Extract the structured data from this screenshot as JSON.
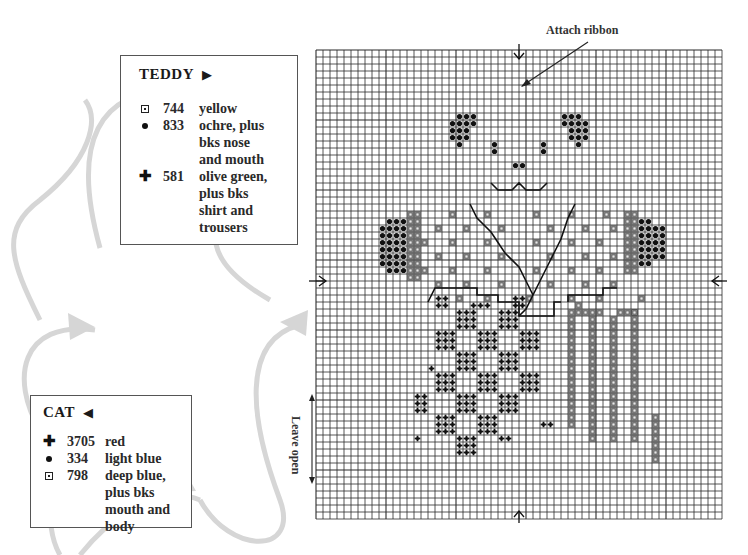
{
  "teddy_key": {
    "title": "TEDDY",
    "title_arrow": "▶",
    "entries": [
      {
        "symbol": "boxed-dot",
        "code": "744",
        "desc": "yellow"
      },
      {
        "symbol": "dot",
        "code": "833",
        "desc": "ochre, plus\nbks nose\nand mouth"
      },
      {
        "symbol": "cross",
        "code": "581",
        "desc": "olive green,\nplus bks\nshirt and\ntrousers"
      }
    ]
  },
  "cat_key": {
    "title": "CAT",
    "title_arrow": "◀",
    "entries": [
      {
        "symbol": "cross",
        "code": "3705",
        "desc": "red"
      },
      {
        "symbol": "dot",
        "code": "334",
        "desc": "light blue"
      },
      {
        "symbol": "boxed-dot",
        "code": "798",
        "desc": "deep blue,\nplus bks\nmouth and\nbody"
      }
    ]
  },
  "annotations": {
    "attach_ribbon": "Attach ribbon",
    "leave_open": "Leave open"
  },
  "symbols": {
    "cross_glyph": "✚",
    "colors": {
      "grid": "#2b2b2b",
      "flow_arrow": "#d4d4d4",
      "ink": "#111111",
      "boxed_fill": "#9a9a9a"
    }
  },
  "grid": {
    "cols": 58,
    "rows": 67,
    "cell": 7,
    "left": 316,
    "top": 50
  },
  "stitches": {
    "dot": [
      [
        20,
        9
      ],
      [
        21,
        9
      ],
      [
        22,
        9
      ],
      [
        19,
        10
      ],
      [
        20,
        10
      ],
      [
        21,
        10
      ],
      [
        22,
        10
      ],
      [
        19,
        11
      ],
      [
        20,
        11
      ],
      [
        21,
        11
      ],
      [
        19,
        12
      ],
      [
        20,
        12
      ],
      [
        21,
        12
      ],
      [
        20,
        13
      ],
      [
        35,
        9
      ],
      [
        36,
        9
      ],
      [
        37,
        9
      ],
      [
        35,
        10
      ],
      [
        36,
        10
      ],
      [
        37,
        10
      ],
      [
        38,
        10
      ],
      [
        36,
        11
      ],
      [
        37,
        11
      ],
      [
        38,
        11
      ],
      [
        36,
        12
      ],
      [
        37,
        12
      ],
      [
        38,
        12
      ],
      [
        37,
        13
      ],
      [
        25,
        13
      ],
      [
        25,
        14
      ],
      [
        32,
        13
      ],
      [
        32,
        14
      ],
      [
        28,
        16
      ],
      [
        29,
        16
      ],
      [
        10,
        24
      ],
      [
        11,
        24
      ],
      [
        12,
        24
      ],
      [
        9,
        25
      ],
      [
        10,
        25
      ],
      [
        11,
        25
      ],
      [
        12,
        25
      ],
      [
        9,
        26
      ],
      [
        10,
        26
      ],
      [
        11,
        26
      ],
      [
        12,
        26
      ],
      [
        9,
        27
      ],
      [
        10,
        27
      ],
      [
        11,
        27
      ],
      [
        12,
        27
      ],
      [
        9,
        28
      ],
      [
        10,
        28
      ],
      [
        11,
        28
      ],
      [
        12,
        28
      ],
      [
        9,
        29
      ],
      [
        10,
        29
      ],
      [
        11,
        29
      ],
      [
        12,
        29
      ],
      [
        9,
        30
      ],
      [
        10,
        30
      ],
      [
        11,
        30
      ],
      [
        12,
        30
      ],
      [
        10,
        31
      ],
      [
        11,
        31
      ],
      [
        12,
        31
      ],
      [
        46,
        24
      ],
      [
        47,
        24
      ],
      [
        46,
        25
      ],
      [
        47,
        25
      ],
      [
        48,
        25
      ],
      [
        49,
        25
      ],
      [
        46,
        26
      ],
      [
        47,
        26
      ],
      [
        48,
        26
      ],
      [
        49,
        26
      ],
      [
        46,
        27
      ],
      [
        47,
        27
      ],
      [
        48,
        27
      ],
      [
        49,
        27
      ],
      [
        46,
        28
      ],
      [
        47,
        28
      ],
      [
        48,
        28
      ],
      [
        49,
        28
      ],
      [
        46,
        29
      ],
      [
        47,
        29
      ],
      [
        48,
        29
      ],
      [
        49,
        29
      ],
      [
        46,
        30
      ],
      [
        47,
        30
      ]
    ],
    "boxed": [
      [
        13,
        23
      ],
      [
        14,
        23
      ],
      [
        13,
        24
      ],
      [
        14,
        24
      ],
      [
        13,
        25
      ],
      [
        14,
        25
      ],
      [
        13,
        26
      ],
      [
        14,
        26
      ],
      [
        13,
        27
      ],
      [
        14,
        27
      ],
      [
        13,
        28
      ],
      [
        14,
        28
      ],
      [
        13,
        29
      ],
      [
        14,
        29
      ],
      [
        13,
        30
      ],
      [
        14,
        30
      ],
      [
        13,
        31
      ],
      [
        14,
        31
      ],
      [
        13,
        32
      ],
      [
        14,
        32
      ],
      [
        44,
        23
      ],
      [
        45,
        23
      ],
      [
        44,
        24
      ],
      [
        45,
        24
      ],
      [
        44,
        25
      ],
      [
        45,
        25
      ],
      [
        44,
        26
      ],
      [
        45,
        26
      ],
      [
        44,
        27
      ],
      [
        45,
        27
      ],
      [
        44,
        28
      ],
      [
        45,
        28
      ],
      [
        44,
        29
      ],
      [
        45,
        29
      ],
      [
        44,
        30
      ],
      [
        45,
        30
      ],
      [
        44,
        31
      ],
      [
        45,
        31
      ],
      [
        19,
        23
      ],
      [
        24,
        23
      ],
      [
        31,
        23
      ],
      [
        36,
        23
      ],
      [
        41,
        23
      ],
      [
        17,
        25
      ],
      [
        21,
        25
      ],
      [
        26,
        25
      ],
      [
        33,
        25
      ],
      [
        38,
        25
      ],
      [
        42,
        25
      ],
      [
        15,
        27
      ],
      [
        19,
        27
      ],
      [
        24,
        27
      ],
      [
        31,
        27
      ],
      [
        36,
        27
      ],
      [
        40,
        27
      ],
      [
        17,
        29
      ],
      [
        21,
        29
      ],
      [
        26,
        29
      ],
      [
        33,
        29
      ],
      [
        38,
        29
      ],
      [
        42,
        29
      ],
      [
        15,
        31
      ],
      [
        19,
        31
      ],
      [
        24,
        31
      ],
      [
        31,
        31
      ],
      [
        36,
        31
      ],
      [
        40,
        31
      ],
      [
        17,
        33
      ],
      [
        21,
        33
      ],
      [
        26,
        33
      ],
      [
        33,
        33
      ],
      [
        38,
        33
      ],
      [
        42,
        33
      ],
      [
        20,
        35
      ],
      [
        24,
        35
      ],
      [
        30,
        35
      ],
      [
        36,
        35
      ],
      [
        40,
        35
      ],
      [
        37,
        36
      ],
      [
        36,
        37
      ],
      [
        37,
        37
      ],
      [
        38,
        37
      ],
      [
        46,
        35
      ],
      [
        40,
        37
      ],
      [
        43,
        37
      ],
      [
        44,
        37
      ],
      [
        45,
        37
      ]
    ],
    "cross": [
      [
        17,
        35
      ],
      [
        18,
        35
      ],
      [
        17,
        36
      ],
      [
        18,
        36
      ],
      [
        28,
        35
      ],
      [
        29,
        35
      ],
      [
        28,
        36
      ],
      [
        29,
        36
      ],
      [
        22,
        36
      ],
      [
        23,
        36
      ],
      [
        24,
        36
      ],
      [
        20,
        37
      ],
      [
        21,
        37
      ],
      [
        22,
        37
      ],
      [
        20,
        38
      ],
      [
        21,
        38
      ],
      [
        22,
        38
      ],
      [
        20,
        39
      ],
      [
        21,
        39
      ],
      [
        22,
        39
      ],
      [
        26,
        37
      ],
      [
        27,
        37
      ],
      [
        28,
        37
      ],
      [
        26,
        38
      ],
      [
        27,
        38
      ],
      [
        28,
        38
      ],
      [
        26,
        39
      ],
      [
        27,
        39
      ],
      [
        28,
        39
      ],
      [
        17,
        40
      ],
      [
        18,
        40
      ],
      [
        19,
        40
      ],
      [
        17,
        41
      ],
      [
        18,
        41
      ],
      [
        19,
        41
      ],
      [
        17,
        42
      ],
      [
        18,
        42
      ],
      [
        19,
        42
      ],
      [
        23,
        40
      ],
      [
        24,
        40
      ],
      [
        25,
        40
      ],
      [
        23,
        41
      ],
      [
        24,
        41
      ],
      [
        25,
        41
      ],
      [
        23,
        42
      ],
      [
        24,
        42
      ],
      [
        25,
        42
      ],
      [
        29,
        40
      ],
      [
        30,
        40
      ],
      [
        31,
        40
      ],
      [
        29,
        41
      ],
      [
        30,
        41
      ],
      [
        31,
        41
      ],
      [
        29,
        42
      ],
      [
        30,
        42
      ],
      [
        31,
        42
      ],
      [
        20,
        43
      ],
      [
        21,
        43
      ],
      [
        22,
        43
      ],
      [
        20,
        44
      ],
      [
        21,
        44
      ],
      [
        22,
        44
      ],
      [
        20,
        45
      ],
      [
        21,
        45
      ],
      [
        22,
        45
      ],
      [
        26,
        43
      ],
      [
        27,
        43
      ],
      [
        28,
        43
      ],
      [
        26,
        44
      ],
      [
        27,
        44
      ],
      [
        28,
        44
      ],
      [
        26,
        45
      ],
      [
        27,
        45
      ],
      [
        28,
        45
      ],
      [
        16,
        45
      ],
      [
        17,
        46
      ],
      [
        18,
        46
      ],
      [
        19,
        46
      ],
      [
        17,
        47
      ],
      [
        18,
        47
      ],
      [
        19,
        47
      ],
      [
        17,
        48
      ],
      [
        18,
        48
      ],
      [
        19,
        48
      ],
      [
        23,
        46
      ],
      [
        24,
        46
      ],
      [
        25,
        46
      ],
      [
        23,
        47
      ],
      [
        24,
        47
      ],
      [
        25,
        47
      ],
      [
        23,
        48
      ],
      [
        24,
        48
      ],
      [
        25,
        48
      ],
      [
        29,
        46
      ],
      [
        30,
        46
      ],
      [
        31,
        46
      ],
      [
        29,
        47
      ],
      [
        30,
        47
      ],
      [
        31,
        47
      ],
      [
        29,
        48
      ],
      [
        30,
        48
      ],
      [
        31,
        48
      ],
      [
        14,
        49
      ],
      [
        15,
        49
      ],
      [
        14,
        50
      ],
      [
        15,
        50
      ],
      [
        14,
        51
      ],
      [
        15,
        51
      ],
      [
        20,
        49
      ],
      [
        21,
        49
      ],
      [
        22,
        49
      ],
      [
        20,
        50
      ],
      [
        21,
        50
      ],
      [
        22,
        50
      ],
      [
        20,
        51
      ],
      [
        21,
        51
      ],
      [
        22,
        51
      ],
      [
        26,
        49
      ],
      [
        27,
        49
      ],
      [
        28,
        49
      ],
      [
        26,
        50
      ],
      [
        27,
        50
      ],
      [
        28,
        50
      ],
      [
        26,
        51
      ],
      [
        27,
        51
      ],
      [
        28,
        51
      ],
      [
        17,
        52
      ],
      [
        18,
        52
      ],
      [
        19,
        52
      ],
      [
        17,
        53
      ],
      [
        18,
        53
      ],
      [
        19,
        53
      ],
      [
        17,
        54
      ],
      [
        18,
        54
      ],
      [
        19,
        54
      ],
      [
        23,
        52
      ],
      [
        24,
        52
      ],
      [
        25,
        52
      ],
      [
        23,
        53
      ],
      [
        24,
        53
      ],
      [
        25,
        53
      ],
      [
        23,
        54
      ],
      [
        24,
        54
      ],
      [
        25,
        54
      ],
      [
        32,
        53
      ],
      [
        33,
        53
      ],
      [
        14,
        55
      ],
      [
        26,
        55
      ],
      [
        27,
        55
      ],
      [
        20,
        55
      ],
      [
        21,
        55
      ],
      [
        22,
        55
      ],
      [
        20,
        56
      ],
      [
        21,
        56
      ],
      [
        22,
        56
      ],
      [
        20,
        57
      ],
      [
        21,
        57
      ],
      [
        22,
        57
      ]
    ],
    "boxed_columns": [
      {
        "col": 36,
        "from": 38,
        "to": 53
      },
      {
        "col": 39,
        "from": 37,
        "to": 55
      },
      {
        "col": 42,
        "from": 38,
        "to": 55
      },
      {
        "col": 45,
        "from": 37,
        "to": 55
      },
      {
        "col": 48,
        "from": 52,
        "to": 58
      }
    ]
  },
  "backstitch_lines": [
    [
      [
        25,
        19
      ],
      [
        26,
        20
      ],
      [
        28,
        20
      ],
      [
        29,
        19
      ],
      [
        30,
        20
      ],
      [
        32,
        20
      ],
      [
        33,
        19
      ]
    ],
    [
      [
        22,
        22
      ],
      [
        23,
        24
      ],
      [
        25,
        26
      ],
      [
        27,
        29
      ],
      [
        29,
        31
      ],
      [
        30,
        33
      ],
      [
        31,
        35
      ]
    ],
    [
      [
        37,
        22
      ],
      [
        36,
        24
      ],
      [
        35,
        27
      ],
      [
        34,
        29
      ],
      [
        33,
        31
      ],
      [
        32,
        33
      ],
      [
        31,
        35
      ]
    ],
    [
      [
        31,
        35
      ],
      [
        30,
        37
      ],
      [
        29,
        38
      ]
    ],
    [
      [
        16,
        36
      ],
      [
        17,
        34
      ],
      [
        23,
        34
      ],
      [
        23,
        35
      ],
      [
        26,
        35
      ],
      [
        26,
        36
      ],
      [
        29,
        36
      ],
      [
        29,
        38
      ],
      [
        34,
        38
      ],
      [
        34,
        36
      ],
      [
        35,
        36
      ]
    ],
    [
      [
        36,
        36
      ],
      [
        36,
        35
      ],
      [
        41,
        35
      ],
      [
        41,
        34
      ],
      [
        43,
        34
      ]
    ]
  ],
  "center_markers": {
    "top_col": 29,
    "bottom_col": 29,
    "left_row": 33,
    "right_row": 33
  }
}
